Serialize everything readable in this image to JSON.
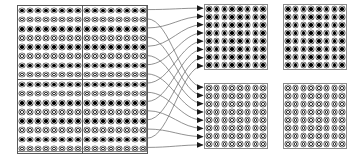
{
  "figure": {
    "background_color": "#ffffff",
    "line_color": "#6e6e6e",
    "border_color": "#8a8a8a",
    "dot_filled_color": "#000000",
    "dot_hollow_color": "#ffffff"
  },
  "source": {
    "name": "source-matrix",
    "description": "Left composite matrix built from four 8x8 quadrants",
    "total_columns": 16,
    "total_rows": 16,
    "quadrant_columns": 8,
    "quadrant_rows": 8,
    "row_pattern": "alternating",
    "row_pattern_legend": [
      "filled",
      "hollow"
    ],
    "quadrants": [
      {
        "name": "source-quadrant-top-left",
        "columns": 8,
        "rows": 8,
        "first_row_style": "filled"
      },
      {
        "name": "source-quadrant-top-right",
        "columns": 8,
        "rows": 8,
        "first_row_style": "filled"
      },
      {
        "name": "source-quadrant-bottom-left",
        "columns": 8,
        "rows": 8,
        "first_row_style": "filled"
      },
      {
        "name": "source-quadrant-bottom-right",
        "columns": 8,
        "rows": 8,
        "first_row_style": "filled"
      }
    ]
  },
  "destinations": [
    {
      "name": "dest-block-top-left",
      "columns": 8,
      "rows": 8,
      "fill_style": "filled",
      "receives_arrows": true,
      "arrow_count": 8
    },
    {
      "name": "dest-block-top-right",
      "columns": 8,
      "rows": 8,
      "fill_style": "filled",
      "receives_arrows": false,
      "arrow_count": 0
    },
    {
      "name": "dest-block-bottom-left",
      "columns": 8,
      "rows": 8,
      "fill_style": "hollow",
      "receives_arrows": true,
      "arrow_count": 8
    },
    {
      "name": "dest-block-bottom-right",
      "columns": 8,
      "rows": 8,
      "fill_style": "hollow",
      "receives_arrows": false,
      "arrow_count": 0
    }
  ],
  "mapping": {
    "name": "row-routing",
    "description": "Each of the 16 source rows is routed to one destination block; odd (filled) rows go to the upper filled block, even (hollow) rows go to the lower hollow block",
    "arrow_total": 16,
    "arrowhead": "solid-triangle",
    "routes": [
      {
        "source_row": 1,
        "target": "dest-block-top-left",
        "target_row": 1,
        "style": "filled"
      },
      {
        "source_row": 2,
        "target": "dest-block-bottom-left",
        "target_row": 1,
        "style": "hollow"
      },
      {
        "source_row": 3,
        "target": "dest-block-top-left",
        "target_row": 2,
        "style": "filled"
      },
      {
        "source_row": 4,
        "target": "dest-block-bottom-left",
        "target_row": 2,
        "style": "hollow"
      },
      {
        "source_row": 5,
        "target": "dest-block-top-left",
        "target_row": 3,
        "style": "filled"
      },
      {
        "source_row": 6,
        "target": "dest-block-bottom-left",
        "target_row": 3,
        "style": "hollow"
      },
      {
        "source_row": 7,
        "target": "dest-block-top-left",
        "target_row": 4,
        "style": "filled"
      },
      {
        "source_row": 8,
        "target": "dest-block-bottom-left",
        "target_row": 4,
        "style": "hollow"
      },
      {
        "source_row": 9,
        "target": "dest-block-top-left",
        "target_row": 5,
        "style": "filled"
      },
      {
        "source_row": 10,
        "target": "dest-block-bottom-left",
        "target_row": 5,
        "style": "hollow"
      },
      {
        "source_row": 11,
        "target": "dest-block-top-left",
        "target_row": 6,
        "style": "filled"
      },
      {
        "source_row": 12,
        "target": "dest-block-bottom-left",
        "target_row": 6,
        "style": "hollow"
      },
      {
        "source_row": 13,
        "target": "dest-block-top-left",
        "target_row": 7,
        "style": "filled"
      },
      {
        "source_row": 14,
        "target": "dest-block-bottom-left",
        "target_row": 7,
        "style": "hollow"
      },
      {
        "source_row": 15,
        "target": "dest-block-top-left",
        "target_row": 8,
        "style": "filled"
      },
      {
        "source_row": 16,
        "target": "dest-block-bottom-left",
        "target_row": 8,
        "style": "hollow"
      }
    ]
  },
  "geometry": {
    "source": {
      "x": 17,
      "y": 5,
      "width": 130,
      "height": 147
    },
    "dest_top_left": {
      "x": 204,
      "y": 4,
      "width": 64,
      "height": 66
    },
    "dest_top_right": {
      "x": 283,
      "y": 4,
      "width": 64,
      "height": 66
    },
    "dest_bottom_left": {
      "x": 204,
      "y": 83,
      "width": 64,
      "height": 66
    },
    "dest_bottom_right": {
      "x": 283,
      "y": 83,
      "width": 64,
      "height": 66
    }
  }
}
